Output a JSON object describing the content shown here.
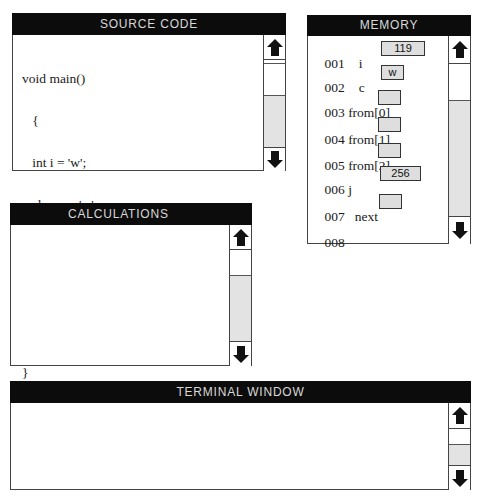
{
  "source_code": {
    "title": "SOURCE CODE",
    "lines": [
      "void main()",
      "   {",
      "   int i = 'w';",
      "   char c = 'w';",
      "   char from[3];",
      "   int j = 256;",
      "   char *next;",
      "}"
    ]
  },
  "memory": {
    "title": "MEMORY",
    "rows": [
      {
        "address": "001",
        "name": "i",
        "value": "119"
      },
      {
        "address": "002",
        "name": "c",
        "value": "w"
      },
      {
        "address": "003",
        "name": "from[0]",
        "value": ""
      },
      {
        "address": "004",
        "name": "from[1]",
        "value": ""
      },
      {
        "address": "005",
        "name": "from[2]",
        "value": ""
      },
      {
        "address": "006",
        "name": "j",
        "value": "256"
      },
      {
        "address": "007",
        "name": "next",
        "value": ""
      },
      {
        "address": "008",
        "name": "",
        "value": ""
      }
    ]
  },
  "calculations": {
    "title": "CALCULATIONS",
    "content": ""
  },
  "terminal": {
    "title": "TERMINAL WINDOW",
    "content": ""
  },
  "icons": {
    "scroll_up": "arrow-up-icon",
    "scroll_down": "arrow-down-icon"
  },
  "colors": {
    "header_bg": "#0c0c0c",
    "header_text": "#d8d8d8",
    "memory_cell": "#dedede",
    "scroll_track": "#e3e3e3"
  }
}
